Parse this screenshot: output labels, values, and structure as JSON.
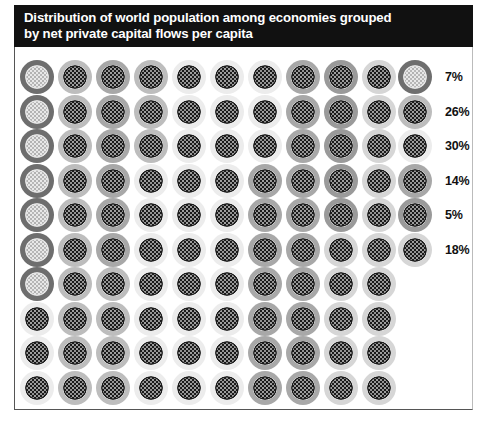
{
  "title": {
    "line1": "Distribution of world population among economies grouped",
    "line2": "by net private capital flows per capita",
    "full": "Distribution of world population among economies grouped\nby net private capital flows per capita"
  },
  "colors": {
    "banner_background": "#111111",
    "banner_text": "#ffffff",
    "panel_background": "#ffffff",
    "label_text": "#111111"
  },
  "legend": {
    "items": [
      {
        "label": "7%",
        "value": 7,
        "category_id": "cat-1",
        "ring_color": "#6e6e6e",
        "core_color": "#8a8a8a",
        "hatch_color": "#e8e8e8"
      },
      {
        "label": "26%",
        "value": 26,
        "category_id": "cat-2",
        "ring_color": "#bdbdbd",
        "core_color": "#ffffff",
        "hatch_color": "#1a1a1a"
      },
      {
        "label": "30%",
        "value": 30,
        "category_id": "cat-3",
        "ring_color": "#ececec",
        "core_color": "#ffffff",
        "hatch_color": "#1a1a1a"
      },
      {
        "label": "14%",
        "value": 14,
        "category_id": "cat-4",
        "ring_color": "#a8a8a8",
        "core_color": "#ffffff",
        "hatch_color": "#1a1a1a"
      },
      {
        "label": "5%",
        "value": 5,
        "category_id": "cat-5",
        "ring_color": "#9a9a9a",
        "core_color": "#ffffff",
        "hatch_color": "#1a1a1a"
      },
      {
        "label": "18%",
        "value": 18,
        "category_id": "cat-6",
        "ring_color": "#d6d6d6",
        "core_color": "#ffffff",
        "hatch_color": "#1a1a1a"
      }
    ]
  },
  "chart_data": {
    "type": "waffle",
    "title": "Distribution of world population among economies grouped by net private capital flows per capita",
    "unit": "percent of world population",
    "dot_value": 1,
    "rows": 10,
    "columns": 10,
    "total": 100,
    "categories": [
      "7%",
      "26%",
      "30%",
      "14%",
      "5%",
      "18%"
    ],
    "values": [
      7,
      26,
      30,
      14,
      5,
      18
    ],
    "legend_position": "right",
    "grid": false,
    "xlabel": "",
    "ylabel": "",
    "matrix": [
      [
        "cat-1",
        "cat-2",
        "cat-4",
        "cat-2",
        "cat-3",
        "cat-3",
        "cat-3",
        "cat-4",
        "cat-5",
        "cat-6"
      ],
      [
        "cat-1",
        "cat-2",
        "cat-4",
        "cat-2",
        "cat-3",
        "cat-3",
        "cat-3",
        "cat-4",
        "cat-5",
        "cat-6"
      ],
      [
        "cat-1",
        "cat-2",
        "cat-4",
        "cat-2",
        "cat-3",
        "cat-3",
        "cat-3",
        "cat-4",
        "cat-5",
        "cat-6"
      ],
      [
        "cat-1",
        "cat-2",
        "cat-4",
        "cat-3",
        "cat-3",
        "cat-3",
        "cat-4",
        "cat-4",
        "cat-5",
        "cat-6"
      ],
      [
        "cat-1",
        "cat-2",
        "cat-4",
        "cat-3",
        "cat-3",
        "cat-3",
        "cat-4",
        "cat-4",
        "cat-5",
        "cat-6"
      ],
      [
        "cat-1",
        "cat-2",
        "cat-4",
        "cat-3",
        "cat-3",
        "cat-3",
        "cat-4",
        "cat-4",
        "cat-6",
        "cat-6"
      ],
      [
        "cat-1",
        "cat-2",
        "cat-2",
        "cat-3",
        "cat-3",
        "cat-3",
        "cat-4",
        "cat-4",
        "cat-6",
        "cat-6"
      ],
      [
        "cat-3",
        "cat-2",
        "cat-2",
        "cat-3",
        "cat-3",
        "cat-3",
        "cat-4",
        "cat-4",
        "cat-6",
        "cat-6"
      ],
      [
        "cat-3",
        "cat-2",
        "cat-2",
        "cat-3",
        "cat-3",
        "cat-3",
        "cat-4",
        "cat-4",
        "cat-6",
        "cat-6"
      ],
      [
        "cat-3",
        "cat-2",
        "cat-2",
        "cat-3",
        "cat-3",
        "cat-3",
        "cat-4",
        "cat-4",
        "cat-6",
        "cat-6"
      ]
    ]
  }
}
